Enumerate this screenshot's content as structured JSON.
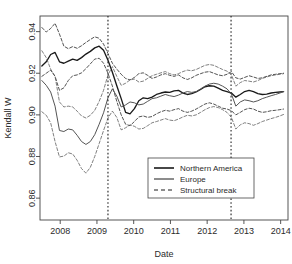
{
  "chart_data": {
    "type": "line",
    "title": "",
    "xlabel": "Date",
    "ylabel": "Kendall W",
    "xlim": [
      2007.45,
      2014.2
    ],
    "ylim": [
      0.8495,
      0.9475
    ],
    "grid": false,
    "legend_position": "bottom-right",
    "xticks": [
      2008,
      2009,
      2010,
      2011,
      2012,
      2013,
      2014
    ],
    "xtick_labels": [
      "2008",
      "2009",
      "2010",
      "2011",
      "2012",
      "2013",
      "2014"
    ],
    "yticks": [
      0.86,
      0.88,
      0.9,
      0.92,
      0.94
    ],
    "ytick_labels": [
      "0.86",
      "0.88",
      "0.90",
      "0.92",
      "0.94"
    ],
    "annotations": [
      {
        "type": "vline",
        "label": "Structural break",
        "x": 2009.3,
        "style": "dotted"
      },
      {
        "type": "vline",
        "label": "Structural break",
        "x": 2012.65,
        "style": "dotted"
      }
    ],
    "series": [
      {
        "name": "Northern America",
        "style": "solid",
        "color": "#1a1a1a",
        "x": [
          2007.5,
          2007.62,
          2007.74,
          2007.86,
          2007.98,
          2008.1,
          2008.22,
          2008.34,
          2008.46,
          2008.58,
          2008.7,
          2008.82,
          2008.94,
          2009.06,
          2009.18,
          2009.3,
          2009.42,
          2009.54,
          2009.66,
          2009.78,
          2009.9,
          2010.02,
          2010.14,
          2010.26,
          2010.38,
          2010.5,
          2010.62,
          2010.74,
          2010.86,
          2010.98,
          2011.1,
          2011.22,
          2011.34,
          2011.46,
          2011.58,
          2011.7,
          2011.82,
          2011.94,
          2012.06,
          2012.18,
          2012.3,
          2012.42,
          2012.54,
          2012.66,
          2012.78,
          2012.9,
          2013.02,
          2013.14,
          2013.26,
          2013.38,
          2013.5,
          2013.62,
          2013.74,
          2013.86,
          2013.98,
          2014.08
        ],
        "values": [
          0.9235,
          0.9255,
          0.929,
          0.93,
          0.9255,
          0.9248,
          0.9258,
          0.9268,
          0.9262,
          0.9275,
          0.9292,
          0.9305,
          0.9322,
          0.933,
          0.931,
          0.9262,
          0.9205,
          0.914,
          0.9078,
          0.9012,
          0.9005,
          0.903,
          0.9068,
          0.9082,
          0.9078,
          0.9085,
          0.9098,
          0.9105,
          0.911,
          0.9108,
          0.9115,
          0.9118,
          0.9105,
          0.9098,
          0.9102,
          0.911,
          0.9122,
          0.9135,
          0.914,
          0.9138,
          0.9128,
          0.9118,
          0.9112,
          0.9105,
          0.9085,
          0.9098,
          0.9112,
          0.9118,
          0.9112,
          0.9102,
          0.9098,
          0.91,
          0.9105,
          0.9108,
          0.911,
          0.9112
        ]
      },
      {
        "name": "Northern America upper band",
        "style": "dashed",
        "color": "#1a1a1a",
        "parent": "Northern America",
        "x": [
          2007.5,
          2007.62,
          2007.74,
          2007.86,
          2007.98,
          2008.1,
          2008.22,
          2008.34,
          2008.46,
          2008.58,
          2008.7,
          2008.82,
          2008.94,
          2009.06,
          2009.18,
          2009.3,
          2009.42,
          2009.54,
          2009.66,
          2009.78,
          2009.9,
          2010.02,
          2010.14,
          2010.26,
          2010.38,
          2010.5,
          2010.62,
          2010.74,
          2010.86,
          2010.98,
          2011.1,
          2011.22,
          2011.34,
          2011.46,
          2011.58,
          2011.7,
          2011.82,
          2011.94,
          2012.06,
          2012.18,
          2012.3,
          2012.42,
          2012.54,
          2012.66,
          2012.78,
          2012.9,
          2013.02,
          2013.14,
          2013.26,
          2013.38,
          2013.5,
          2013.62,
          2013.74,
          2013.86,
          2013.98,
          2014.08
        ],
        "values": [
          0.942,
          0.9398,
          0.9415,
          0.944,
          0.9388,
          0.933,
          0.9318,
          0.9328,
          0.932,
          0.9332,
          0.9348,
          0.9362,
          0.9375,
          0.9368,
          0.934,
          0.9295,
          0.9248,
          0.922,
          0.9195,
          0.9175,
          0.9168,
          0.918,
          0.9198,
          0.9202,
          0.919,
          0.9175,
          0.9182,
          0.9192,
          0.9198,
          0.919,
          0.9185,
          0.9192,
          0.9178,
          0.917,
          0.9178,
          0.919,
          0.9198,
          0.9205,
          0.9208,
          0.92,
          0.9192,
          0.9188,
          0.9195,
          0.9208,
          0.9178,
          0.9172,
          0.918,
          0.9188,
          0.9182,
          0.9175,
          0.9178,
          0.9185,
          0.9192,
          0.9195,
          0.9198,
          0.92
        ]
      },
      {
        "name": "Northern America lower band",
        "style": "dashed",
        "color": "#1a1a1a",
        "parent": "Northern America",
        "x": [
          2007.5,
          2007.62,
          2007.74,
          2007.86,
          2007.98,
          2008.1,
          2008.22,
          2008.34,
          2008.46,
          2008.58,
          2008.7,
          2008.82,
          2008.94,
          2009.06,
          2009.18,
          2009.3,
          2009.42,
          2009.54,
          2009.66,
          2009.78,
          2009.9,
          2010.02,
          2010.14,
          2010.26,
          2010.38,
          2010.5,
          2010.62,
          2010.74,
          2010.86,
          2010.98,
          2011.1,
          2011.22,
          2011.34,
          2011.46,
          2011.58,
          2011.7,
          2011.82,
          2011.94,
          2012.06,
          2012.18,
          2012.3,
          2012.42,
          2012.54,
          2012.66,
          2012.78,
          2012.9,
          2013.02,
          2013.14,
          2013.26,
          2013.38,
          2013.5,
          2013.62,
          2013.74,
          2013.86,
          2013.98,
          2014.08
        ],
        "values": [
          0.9185,
          0.92,
          0.9215,
          0.9185,
          0.9118,
          0.913,
          0.9165,
          0.9188,
          0.9192,
          0.9202,
          0.9222,
          0.9245,
          0.9268,
          0.9272,
          0.9248,
          0.92,
          0.9138,
          0.9065,
          0.9,
          0.8955,
          0.8948,
          0.8968,
          0.899,
          0.8995,
          0.8988,
          0.8992,
          0.9005,
          0.9015,
          0.9022,
          0.9018,
          0.9025,
          0.903,
          0.9018,
          0.9012,
          0.9018,
          0.9028,
          0.904,
          0.9052,
          0.9058,
          0.9052,
          0.9042,
          0.9032,
          0.9028,
          0.902,
          0.9,
          0.9012,
          0.9025,
          0.9032,
          0.9028,
          0.9018,
          0.9012,
          0.9015,
          0.902,
          0.9022,
          0.9025,
          0.9028
        ]
      },
      {
        "name": "Europe",
        "style": "solid",
        "color": "#555555",
        "x": [
          2007.5,
          2007.62,
          2007.74,
          2007.86,
          2007.98,
          2008.1,
          2008.22,
          2008.34,
          2008.46,
          2008.58,
          2008.7,
          2008.82,
          2008.94,
          2009.06,
          2009.18,
          2009.3,
          2009.42,
          2009.54,
          2009.66,
          2009.78,
          2009.9,
          2010.02,
          2010.14,
          2010.26,
          2010.38,
          2010.5,
          2010.62,
          2010.74,
          2010.86,
          2010.98,
          2011.1,
          2011.22,
          2011.34,
          2011.46,
          2011.58,
          2011.7,
          2011.82,
          2011.94,
          2012.06,
          2012.18,
          2012.3,
          2012.42,
          2012.54,
          2012.66,
          2012.78,
          2012.9,
          2013.02,
          2013.14,
          2013.26,
          2013.38,
          2013.5,
          2013.62,
          2013.74,
          2013.86,
          2013.98,
          2014.08
        ],
        "values": [
          0.9165,
          0.9142,
          0.911,
          0.9042,
          0.8925,
          0.892,
          0.8932,
          0.8928,
          0.8902,
          0.8872,
          0.8858,
          0.8872,
          0.8905,
          0.8955,
          0.901,
          0.9082,
          0.9125,
          0.909,
          0.9038,
          0.9048,
          0.9062,
          0.9058,
          0.9048,
          0.9052,
          0.9065,
          0.9078,
          0.9082,
          0.909,
          0.9098,
          0.9092,
          0.9088,
          0.9095,
          0.9105,
          0.9112,
          0.9108,
          0.9112,
          0.9125,
          0.9138,
          0.9148,
          0.9152,
          0.9148,
          0.9138,
          0.9125,
          0.91,
          0.9042,
          0.9062,
          0.9072,
          0.9068,
          0.9062,
          0.9068,
          0.9078,
          0.9085,
          0.9092,
          0.9098,
          0.9105,
          0.9112
        ]
      },
      {
        "name": "Europe upper band",
        "style": "dashed",
        "color": "#555555",
        "parent": "Europe",
        "x": [
          2007.5,
          2007.62,
          2007.74,
          2007.86,
          2007.98,
          2008.1,
          2008.22,
          2008.34,
          2008.46,
          2008.58,
          2008.7,
          2008.82,
          2008.94,
          2009.06,
          2009.18,
          2009.3,
          2009.42,
          2009.54,
          2009.66,
          2009.78,
          2009.9,
          2010.02,
          2010.14,
          2010.26,
          2010.38,
          2010.5,
          2010.62,
          2010.74,
          2010.86,
          2010.98,
          2011.1,
          2011.22,
          2011.34,
          2011.46,
          2011.58,
          2011.7,
          2011.82,
          2011.94,
          2012.06,
          2012.18,
          2012.3,
          2012.42,
          2012.54,
          2012.66,
          2012.78,
          2012.9,
          2013.02,
          2013.14,
          2013.26,
          2013.38,
          2013.5,
          2013.62,
          2013.74,
          2013.86,
          2013.98,
          2014.08
        ],
        "values": [
          0.9308,
          0.9275,
          0.922,
          0.9185,
          0.9062,
          0.9038,
          0.9042,
          0.9038,
          0.9018,
          0.8995,
          0.8985,
          0.8998,
          0.9022,
          0.9065,
          0.9118,
          0.9192,
          0.9232,
          0.9185,
          0.9142,
          0.9152,
          0.9168,
          0.9172,
          0.9158,
          0.9162,
          0.9175,
          0.9188,
          0.9195,
          0.9202,
          0.9208,
          0.9198,
          0.9192,
          0.9198,
          0.9208,
          0.9215,
          0.9212,
          0.9218,
          0.9228,
          0.9238,
          0.9242,
          0.9238,
          0.9228,
          0.9218,
          0.921,
          0.9192,
          0.9138,
          0.9155,
          0.9165,
          0.9162,
          0.9158,
          0.9165,
          0.9175,
          0.9182,
          0.9188,
          0.9192,
          0.9195,
          0.9198
        ]
      },
      {
        "name": "Europe lower band",
        "style": "dashed",
        "color": "#555555",
        "parent": "Europe",
        "x": [
          2007.5,
          2007.62,
          2007.74,
          2007.86,
          2007.98,
          2008.1,
          2008.22,
          2008.34,
          2008.46,
          2008.58,
          2008.7,
          2008.82,
          2008.94,
          2009.06,
          2009.18,
          2009.3,
          2009.42,
          2009.54,
          2009.66,
          2009.78,
          2009.9,
          2010.02,
          2010.14,
          2010.26,
          2010.38,
          2010.5,
          2010.62,
          2010.74,
          2010.86,
          2010.98,
          2011.1,
          2011.22,
          2011.34,
          2011.46,
          2011.58,
          2011.7,
          2011.82,
          2011.94,
          2012.06,
          2012.18,
          2012.3,
          2012.42,
          2012.54,
          2012.66,
          2012.78,
          2012.9,
          2013.02,
          2013.14,
          2013.26,
          2013.38,
          2013.5,
          2013.62,
          2013.74,
          2013.86,
          2013.98,
          2014.08
        ],
        "values": [
          0.9015,
          0.8998,
          0.8962,
          0.8872,
          0.8798,
          0.8802,
          0.8818,
          0.8812,
          0.8782,
          0.8742,
          0.872,
          0.8748,
          0.88,
          0.8862,
          0.8925,
          0.8985,
          0.9018,
          0.8988,
          0.8928,
          0.8938,
          0.8952,
          0.8945,
          0.8932,
          0.8935,
          0.8948,
          0.8962,
          0.8968,
          0.8975,
          0.8982,
          0.8975,
          0.8972,
          0.898,
          0.899,
          0.8998,
          0.8995,
          0.9,
          0.9012,
          0.9025,
          0.9035,
          0.904,
          0.9035,
          0.9025,
          0.9012,
          0.8988,
          0.8932,
          0.8952,
          0.8962,
          0.8958,
          0.895,
          0.8958,
          0.8968,
          0.8975,
          0.8982,
          0.8988,
          0.8995,
          0.9002
        ]
      }
    ]
  },
  "legend": {
    "items": [
      {
        "label": "Northern America",
        "style": "solid",
        "weight": "bold"
      },
      {
        "label": "Europe",
        "style": "solid",
        "weight": "normal"
      },
      {
        "label": "Structural break",
        "style": "dashed",
        "weight": "normal"
      }
    ]
  }
}
